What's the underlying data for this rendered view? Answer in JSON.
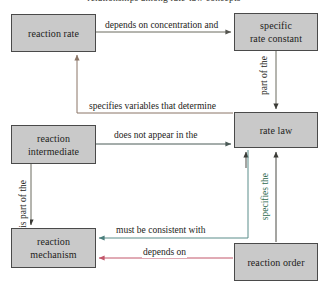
{
  "diagram": {
    "title_clipped": "relationships among rate-law concepts",
    "type": "concept-map",
    "canvas": {
      "width": 328,
      "height": 290,
      "background": "#ffffff"
    },
    "node_style": {
      "fill": "#c9c9c9",
      "border": "#4a4a4a",
      "text": "#1d1d1b"
    },
    "nodes": [
      {
        "id": "reaction-rate",
        "label": "reaction rate"
      },
      {
        "id": "specific-rate-constant",
        "label": "specific\nrate constant"
      },
      {
        "id": "reaction-intermediate",
        "label": "reaction\nintermediate"
      },
      {
        "id": "rate-law",
        "label": "rate law"
      },
      {
        "id": "reaction-mechanism",
        "label": "reaction\nmechanism"
      },
      {
        "id": "reaction-order",
        "label": "reaction order"
      }
    ],
    "edges": [
      {
        "id": "rate-to-constant",
        "from": "reaction-rate",
        "to": "specific-rate-constant",
        "label": "depends on concentration and",
        "orientation": "horizontal",
        "color": "#6b6b5e"
      },
      {
        "id": "constant-to-ratelaw",
        "from": "specific-rate-constant",
        "to": "rate-law",
        "label": "part of the",
        "orientation": "vertical",
        "color": "#6b6b5e"
      },
      {
        "id": "ratelaw-to-rate",
        "from": "rate-law",
        "to": "reaction-rate",
        "label": "specifies variables that determine",
        "orientation": "horizontal",
        "color": "#8a7566"
      },
      {
        "id": "intermediate-to-ratelaw",
        "from": "reaction-intermediate",
        "to": "rate-law",
        "label": "does not appear in the",
        "orientation": "horizontal",
        "color": "#4a5a57"
      },
      {
        "id": "intermediate-to-mechanism",
        "from": "reaction-intermediate",
        "to": "reaction-mechanism",
        "label": "is part of the",
        "orientation": "vertical",
        "color": "#6b6b5e"
      },
      {
        "id": "order-to-ratelaw",
        "from": "reaction-order",
        "to": "rate-law",
        "label": "specifies the",
        "orientation": "vertical",
        "color": "#4a4a44"
      },
      {
        "id": "ratelaw-to-mechanism",
        "from": "rate-law",
        "to": "reaction-mechanism",
        "label": "must be consistent with",
        "orientation": "horizontal",
        "color": "#5a8d8a"
      },
      {
        "id": "order-to-mechanism",
        "from": "reaction-order",
        "to": "reaction-mechanism",
        "label": "depends on",
        "orientation": "horizontal",
        "color": "#c2566a"
      }
    ]
  }
}
